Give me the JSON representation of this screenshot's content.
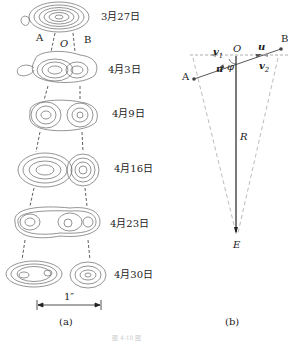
{
  "figure_a": {
    "caption": "(a)",
    "top_labels": {
      "A": "A",
      "O": "O",
      "B": "B"
    },
    "dates": [
      "3月27日",
      "4月3日",
      "4月9日",
      "4月16日",
      "4月23日",
      "4月30日"
    ],
    "scale_bar_label": "1″"
  },
  "figure_b": {
    "caption": "(b)",
    "points": {
      "A": "A",
      "B": "B",
      "O": "O",
      "E": "E"
    },
    "vectors": {
      "v1": "v",
      "v1_sub": "1",
      "v2": "v",
      "v2_sub": "2",
      "u_right": "u",
      "u_left": "u"
    },
    "angle": "φ",
    "radius": "R"
  },
  "footer_text": "图 4-18 图"
}
